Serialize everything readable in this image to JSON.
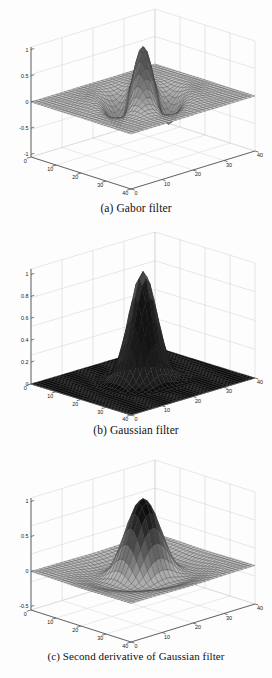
{
  "document": {
    "background_color": "#fdfdfd",
    "ink_color": "#111111"
  },
  "figures": [
    {
      "id": "fig-a",
      "caption": "(a) Gabor filter",
      "chart_data": {
        "type": "surface",
        "title": "",
        "surface_function": "gabor",
        "description": "3D mesh surface of a 2D Gabor filter: a sinusoidally modulated Gaussian producing a central positive ridge flanked by negative troughs on a flat zero plane.",
        "xlabel": "",
        "ylabel": "",
        "zlabel": "",
        "grid": true,
        "legend": "none",
        "mesh_color": "#3a3a3a",
        "axis_color": "#555555",
        "gridline_color": "#cccccc",
        "x_axis": {
          "label": "",
          "ticks": [
            0,
            10,
            20,
            30,
            40
          ],
          "tick_labels": [
            "0",
            "10",
            "20",
            "30",
            "40"
          ],
          "range": [
            0,
            40
          ]
        },
        "y_axis": {
          "label": "",
          "ticks": [
            0,
            10,
            20,
            30,
            40
          ],
          "tick_labels": [
            "0",
            "10",
            "20",
            "30",
            "40"
          ],
          "range": [
            0,
            40
          ]
        },
        "z_axis": {
          "label": "",
          "ticks": [
            -1,
            -0.5,
            0,
            0.5,
            1
          ],
          "tick_labels": [
            "-1",
            "-0.5",
            "0",
            "0.5",
            "1"
          ],
          "range": [
            -1,
            1
          ]
        },
        "peak_value": 1.0,
        "min_value": -1.0
      }
    },
    {
      "id": "fig-b",
      "caption": "(b) Gaussian filter",
      "chart_data": {
        "type": "surface",
        "title": "",
        "surface_function": "gaussian",
        "description": "3D mesh surface of a 2D Gaussian filter: a single symmetric positive peak at the centre decaying to a flat dark zero plane.",
        "xlabel": "",
        "ylabel": "",
        "zlabel": "",
        "grid": true,
        "legend": "none",
        "mesh_color": "#151515",
        "axis_color": "#555555",
        "gridline_color": "#cccccc",
        "x_axis": {
          "label": "",
          "ticks": [
            0,
            10,
            20,
            30,
            40
          ],
          "tick_labels": [
            "0",
            "10",
            "20",
            "30",
            "40"
          ],
          "range": [
            0,
            40
          ]
        },
        "y_axis": {
          "label": "",
          "ticks": [
            0,
            10,
            20,
            30,
            40
          ],
          "tick_labels": [
            "0",
            "10",
            "20",
            "30",
            "40"
          ],
          "range": [
            0,
            40
          ]
        },
        "z_axis": {
          "label": "",
          "ticks": [
            0,
            0.2,
            0.4,
            0.6,
            0.8,
            1
          ],
          "tick_labels": [
            "0",
            "0.2",
            "0.4",
            "0.6",
            "0.8",
            "1"
          ],
          "range": [
            0,
            1
          ]
        },
        "peak_value": 1.0,
        "min_value": 0.0
      }
    },
    {
      "id": "fig-c",
      "caption": "(c) Second derivative of Gaussian filter",
      "chart_data": {
        "type": "surface",
        "title": "",
        "surface_function": "second-derivative-gaussian",
        "description": "3D mesh surface of the second derivative of a Gaussian filter: a tall central positive lobe surrounded by a shallow negative ring on a flat plane.",
        "xlabel": "",
        "ylabel": "",
        "zlabel": "",
        "grid": true,
        "legend": "none",
        "mesh_color": "#3a3a3a",
        "axis_color": "#555555",
        "gridline_color": "#cccccc",
        "x_axis": {
          "label": "",
          "ticks": [
            0,
            10,
            20,
            30,
            40
          ],
          "tick_labels": [
            "0",
            "10",
            "20",
            "30",
            "40"
          ],
          "range": [
            0,
            40
          ]
        },
        "y_axis": {
          "label": "",
          "ticks": [
            0,
            10,
            20,
            30,
            40
          ],
          "tick_labels": [
            "0",
            "10",
            "20",
            "30",
            "40"
          ],
          "range": [
            0,
            40
          ]
        },
        "z_axis": {
          "label": "",
          "ticks": [
            -0.5,
            0,
            0.5,
            1
          ],
          "tick_labels": [
            "-0.5",
            "0",
            "0.5",
            "1"
          ],
          "range": [
            -0.5,
            1
          ]
        },
        "peak_value": 1.0,
        "min_value": -0.5
      }
    }
  ]
}
